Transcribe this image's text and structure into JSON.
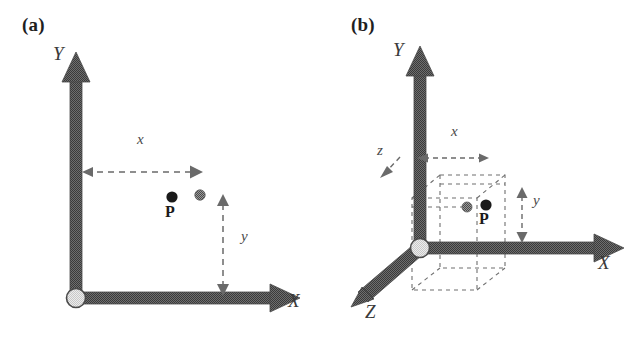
{
  "figure": {
    "background_color": "#ffffff",
    "axis_color": "#5c5c5c",
    "axis_edge_color": "#3a3a3a",
    "dash_color": "#6a6a6a",
    "origin_fill_color": "#dcdcdc",
    "origin_stroke_color": "#4a4a4a",
    "point_black_color": "#1a1a1a",
    "point_gray_color": "#8a8a8a"
  },
  "panels": [
    {
      "id": "panel-a",
      "tag": "(a)",
      "tag_pos": {
        "x": 22,
        "y": 18
      },
      "type": "2d-cartesian",
      "axes": [
        {
          "name": "Y",
          "label": "Y",
          "label_pos": {
            "x": 53,
            "y": 52
          },
          "from": {
            "x": 76,
            "y": 298
          },
          "to": {
            "x": 76,
            "y": 60
          }
        },
        {
          "name": "X",
          "label": "X",
          "label_pos": {
            "x": 288,
            "y": 297
          },
          "from": {
            "x": 76,
            "y": 298
          },
          "to": {
            "x": 298,
            "y": 298
          }
        }
      ],
      "origin": {
        "x": 76,
        "y": 298,
        "r": 9
      },
      "points": [
        {
          "name": "P",
          "kind": "black",
          "x": 172,
          "y": 197,
          "r": 5.5,
          "label": "P",
          "label_pos": {
            "x": 165,
            "y": 205
          }
        },
        {
          "name": "projection-marker",
          "kind": "gray",
          "x": 200,
          "y": 195,
          "r": 5
        }
      ],
      "dimensions": [
        {
          "name": "x",
          "label": "x",
          "label_pos": {
            "x": 137,
            "y": 139
          },
          "orientation": "horizontal",
          "from": {
            "x": 78,
            "y": 172
          },
          "to": {
            "x": 201,
            "y": 172
          }
        },
        {
          "name": "y",
          "label": "y",
          "label_pos": {
            "x": 244,
            "y": 236
          },
          "orientation": "vertical",
          "from": {
            "x": 223,
            "y": 196
          },
          "to": {
            "x": 223,
            "y": 294
          }
        }
      ]
    },
    {
      "id": "panel-b",
      "tag": "(b)",
      "tag_pos": {
        "x": 351,
        "y": 18
      },
      "type": "3d-cartesian",
      "axes": [
        {
          "name": "Y",
          "label": "Y",
          "label_pos": {
            "x": 393,
            "y": 48
          },
          "from": {
            "x": 420,
            "y": 248
          },
          "to": {
            "x": 420,
            "y": 55
          }
        },
        {
          "name": "X",
          "label": "X",
          "label_pos": {
            "x": 598,
            "y": 259
          },
          "from": {
            "x": 420,
            "y": 248
          },
          "to": {
            "x": 624,
            "y": 248
          }
        },
        {
          "name": "Z",
          "label": "Z",
          "label_pos": {
            "x": 365,
            "y": 308
          },
          "from": {
            "x": 420,
            "y": 248
          },
          "to": {
            "x": 355,
            "y": 303
          }
        }
      ],
      "origin": {
        "x": 420,
        "y": 248,
        "r": 9
      },
      "points": [
        {
          "name": "P",
          "kind": "black",
          "x": 486,
          "y": 205,
          "r": 5.5,
          "label": "P",
          "label_pos": {
            "x": 479,
            "y": 212
          }
        },
        {
          "name": "projection-marker",
          "kind": "gray",
          "x": 467,
          "y": 207,
          "r": 5
        }
      ],
      "dimensions": [
        {
          "name": "x",
          "label": "x",
          "label_pos": {
            "x": 452,
            "y": 131
          },
          "orientation": "horizontal",
          "from": {
            "x": 419,
            "y": 158
          },
          "to": {
            "x": 488,
            "y": 158
          }
        },
        {
          "name": "y",
          "label": "y",
          "label_pos": {
            "x": 535,
            "y": 200
          },
          "orientation": "vertical",
          "from": {
            "x": 522,
            "y": 188
          },
          "to": {
            "x": 522,
            "y": 242
          }
        },
        {
          "name": "z",
          "label": "z",
          "label_pos": {
            "x": 379,
            "y": 150
          },
          "orientation": "diagonal",
          "from": {
            "x": 403,
            "y": 155
          },
          "to": {
            "x": 381,
            "y": 178
          }
        }
      ],
      "projection_box": {
        "name": "dashed-projection-box",
        "front_face": [
          {
            "x": 440,
            "y": 175
          },
          {
            "x": 505,
            "y": 175
          },
          {
            "x": 505,
            "y": 268
          },
          {
            "x": 440,
            "y": 268
          }
        ],
        "back_face": [
          {
            "x": 412,
            "y": 198
          },
          {
            "x": 477,
            "y": 198
          },
          {
            "x": 477,
            "y": 290
          },
          {
            "x": 412,
            "y": 290
          }
        ]
      }
    }
  ]
}
